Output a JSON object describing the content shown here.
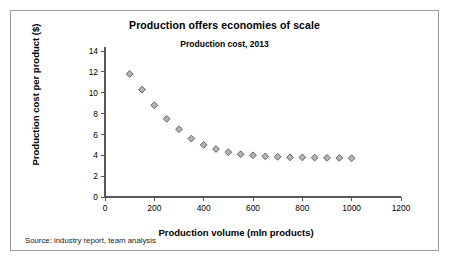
{
  "figure": {
    "source_note": "Source: industry report, team analysis",
    "border_color": "#9a9a9a",
    "background": "#ffffff"
  },
  "chart_data": {
    "type": "scatter",
    "title": "Production offers economies of scale",
    "subtitle": "Production cost, 2013",
    "xlabel": "Production volume (mln products)",
    "ylabel": "Production cost per product ($)",
    "xlim": [
      0,
      1200
    ],
    "ylim": [
      0,
      14
    ],
    "xticks": [
      0,
      200,
      400,
      600,
      800,
      1000,
      1200
    ],
    "yticks": [
      0,
      2,
      4,
      6,
      8,
      10,
      12,
      14
    ],
    "grid": false,
    "legend": "none",
    "marker": "diamond",
    "marker_fill": "#b3b3b3",
    "marker_edge": "#58585a",
    "series": [
      {
        "name": "Production cost per product",
        "x": [
          100,
          150,
          200,
          250,
          300,
          350,
          400,
          450,
          500,
          550,
          600,
          650,
          700,
          750,
          800,
          850,
          900,
          950,
          1000
        ],
        "y": [
          11.8,
          10.3,
          8.8,
          7.5,
          6.5,
          5.6,
          5.0,
          4.6,
          4.3,
          4.1,
          4.0,
          3.9,
          3.85,
          3.8,
          3.8,
          3.78,
          3.75,
          3.75,
          3.72
        ]
      }
    ]
  }
}
